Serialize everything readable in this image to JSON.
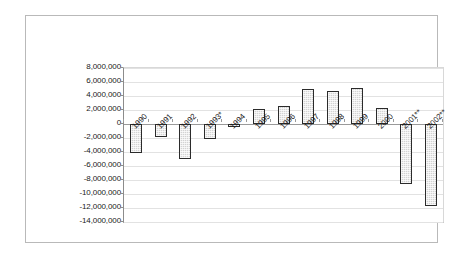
{
  "chart_data": {
    "type": "bar",
    "title": "",
    "subtitle": "",
    "xlabel": "",
    "ylabel": "",
    "categories": [
      "1990",
      "1991",
      "1992",
      "1993*",
      "1994",
      "1995",
      "1996",
      "1997",
      "1998",
      "1999",
      "2000",
      "2001**",
      "2002**"
    ],
    "values": [
      -4200000,
      -1900000,
      -5000000,
      -2200000,
      -450000,
      2200000,
      2600000,
      5000000,
      4700000,
      5100000,
      2300000,
      -8600000,
      -11700000
    ],
    "series": [
      {
        "name": "Series 1",
        "values": [
          -4200000,
          -1900000,
          -5000000,
          -2200000,
          -450000,
          2200000,
          2600000,
          5000000,
          4700000,
          5100000,
          2300000,
          -8600000,
          -11700000
        ]
      }
    ],
    "ylim": [
      -14000000,
      8000000
    ],
    "ytick_step": 2000000,
    "ytick_labels": [
      "8,000,000",
      "6,000,000",
      "4,000,000",
      "2,000,000",
      "0",
      "-2,000,000",
      "-4,000,000",
      "-6,000,000",
      "-8,000,000",
      "-10,000,000",
      "-12,000,000",
      "-14,000,000"
    ],
    "ytick_values": [
      8000000,
      6000000,
      4000000,
      2000000,
      0,
      -2000000,
      -4000000,
      -6000000,
      -8000000,
      -10000000,
      -12000000,
      -14000000
    ],
    "grid": true,
    "legend": false,
    "legend_position": "none",
    "annotations": [],
    "colors": {
      "bar_fill": "#d3d3d3",
      "bar_border": "#2b2b2b",
      "gridline": "#e2e2e2",
      "axis": "#8c8c8c",
      "frame": "#b9b9b9",
      "text": "#1a1a1a",
      "background": "#ffffff"
    }
  }
}
